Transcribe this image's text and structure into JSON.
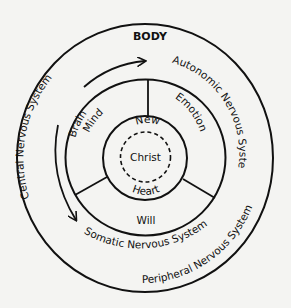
{
  "title": "BODY",
  "outer_ring": {
    "left_label": "Central Nervous System",
    "right_label": "Peripheral Nervous System"
  },
  "arrow_ring": {
    "top_label": "Brain",
    "top_right_label": "Autonomic Nervous System",
    "bottom_label": "Somatic Nervous System"
  },
  "soul_ring": {
    "segments": [
      {
        "label": "Mind"
      },
      {
        "label": "Emotion"
      },
      {
        "label": "Will"
      }
    ]
  },
  "core": {
    "top_label": "New",
    "center_label": "Christ",
    "bottom_label": "Heart"
  },
  "colors": {
    "background": "#f4f4f2",
    "stroke": "#111111"
  }
}
